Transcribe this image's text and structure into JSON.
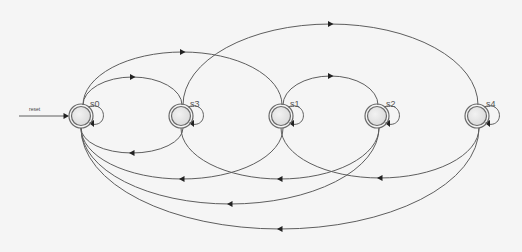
{
  "diagram": {
    "type": "finite-state-machine",
    "colors": {
      "background": "#f5f5f5",
      "edge": "#5e5e5e",
      "arrowhead": "#222222",
      "state_stroke": "#6a6a6a",
      "state_fill_light": "#f2f2f2",
      "state_fill_dark": "#d8d8d8"
    },
    "start": {
      "label": "reset",
      "target": "s0",
      "x1": 19,
      "x2": 68,
      "y": 116
    },
    "state_radius": {
      "outer": 12,
      "inner": 9.5
    },
    "states": [
      {
        "id": "s0",
        "label": "s0",
        "cx": 81,
        "cy": 116
      },
      {
        "id": "s3",
        "label": "s3",
        "cx": 181,
        "cy": 116
      },
      {
        "id": "s1",
        "label": "s1",
        "cx": 281,
        "cy": 116
      },
      {
        "id": "s2",
        "label": "s2",
        "cx": 377,
        "cy": 116
      },
      {
        "id": "s4",
        "label": "s4",
        "cx": 477,
        "cy": 116
      }
    ],
    "transitions": [
      {
        "from": "s0",
        "to": "s0",
        "kind": "self-loop"
      },
      {
        "from": "s3",
        "to": "s3",
        "kind": "self-loop"
      },
      {
        "from": "s1",
        "to": "s1",
        "kind": "self-loop"
      },
      {
        "from": "s2",
        "to": "s2",
        "kind": "self-loop"
      },
      {
        "from": "s4",
        "to": "s4",
        "kind": "self-loop"
      },
      {
        "from": "s0",
        "to": "s3",
        "kind": "arc",
        "side": "top",
        "depth": 28
      },
      {
        "from": "s0",
        "to": "s1",
        "kind": "arc",
        "side": "top",
        "depth": 53
      },
      {
        "from": "s1",
        "to": "s2",
        "kind": "arc",
        "side": "top",
        "depth": 29
      },
      {
        "from": "s3",
        "to": "s4",
        "kind": "arc",
        "side": "top",
        "depth": 81
      },
      {
        "from": "s3",
        "to": "s0",
        "kind": "arc",
        "side": "bottom",
        "depth": 25
      },
      {
        "from": "s1",
        "to": "s0",
        "kind": "arc",
        "side": "bottom",
        "depth": 51
      },
      {
        "from": "s2",
        "to": "s3",
        "kind": "arc",
        "side": "bottom",
        "depth": 51
      },
      {
        "from": "s4",
        "to": "s1",
        "kind": "arc",
        "side": "bottom",
        "depth": 50
      },
      {
        "from": "s2",
        "to": "s0",
        "kind": "arc",
        "side": "bottom",
        "depth": 76
      },
      {
        "from": "s4",
        "to": "s0",
        "kind": "arc",
        "side": "bottom",
        "depth": 101
      }
    ]
  }
}
